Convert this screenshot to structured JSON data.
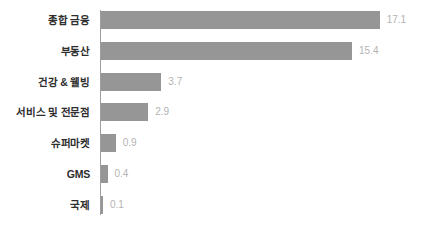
{
  "chart_data": {
    "type": "bar",
    "orientation": "horizontal",
    "title": "",
    "subtitle": "",
    "xlabel": "",
    "ylabel": "",
    "grid": false,
    "legend": false,
    "legend_position": "none",
    "xlim": [
      0,
      17.1
    ],
    "categories": [
      "종합 금융",
      "부동산",
      "건강 & 웰빙",
      "서비스 및 전문점",
      "슈퍼마켓",
      "GMS",
      "국제"
    ],
    "values": [
      17.1,
      15.4,
      3.7,
      2.9,
      0.9,
      0.4,
      0.1
    ],
    "value_labels": [
      "17.1",
      "15.4",
      "3.7",
      "2.9",
      "0.9",
      "0.4",
      "0.1"
    ],
    "bars": [
      {
        "category": "종합 금융",
        "value": 17.1,
        "label": "17.1"
      },
      {
        "category": "부동산",
        "value": 15.4,
        "label": "15.4"
      },
      {
        "category": "건강 & 웰빙",
        "value": 3.7,
        "label": "3.7"
      },
      {
        "category": "서비스 및 전문점",
        "value": 2.9,
        "label": "2.9"
      },
      {
        "category": "슈퍼마켓",
        "value": 0.9,
        "label": "0.9"
      },
      {
        "category": "GMS",
        "value": 0.4,
        "label": "0.4"
      },
      {
        "category": "국제",
        "value": 0.1,
        "label": "0.1"
      }
    ]
  },
  "colors": {
    "bar": "#969696",
    "axis": "#9e9e9e",
    "category_text": "#2e2e2e",
    "value_text": "#b3b3b3",
    "background": "#ffffff"
  }
}
